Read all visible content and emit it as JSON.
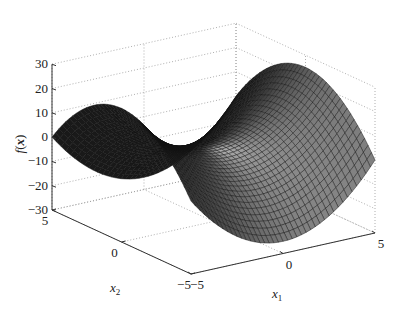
{
  "chart_data": {
    "type": "surface3d",
    "title": "",
    "function_shape": "saddle",
    "approx_formula": "f = x1^2 - x2^2",
    "xlabel": "x1",
    "ylabel": "x2",
    "zlabel": "f(x)",
    "x1_ticks": [
      -5,
      0,
      5
    ],
    "x2_ticks": [
      -5,
      0,
      5
    ],
    "z_ticks": [
      -30,
      -20,
      -10,
      0,
      10,
      20,
      30
    ],
    "x1_range": [
      -5,
      5
    ],
    "x2_range": [
      -5,
      5
    ],
    "zlim": [
      -30,
      30
    ],
    "grid": true,
    "grid_style": "dotted",
    "mesh_resolution": 41,
    "colormap": "gray",
    "edge_color": "#111111",
    "sample_points": [
      {
        "x1": -5,
        "x2": 0,
        "f": 25
      },
      {
        "x1": 5,
        "x2": 0,
        "f": 25
      },
      {
        "x1": 0,
        "x2": -5,
        "f": -25
      },
      {
        "x1": 0,
        "x2": 5,
        "f": -25
      },
      {
        "x1": 0,
        "x2": 0,
        "f": 0
      },
      {
        "x1": 5,
        "x2": 5,
        "f": 0
      },
      {
        "x1": -5,
        "x2": -5,
        "f": 0
      }
    ]
  },
  "labels": {
    "zlabel_f": "f",
    "zlabel_paren_open": "(",
    "zlabel_x": "x",
    "zlabel_paren_close": ")",
    "x1_main": "x",
    "x1_sub": "1",
    "x2_main": "x",
    "x2_sub": "2"
  },
  "projection": {
    "front_corner_px": [
      191,
      274
    ],
    "px_per_unit_x1": [
      18.4,
      -4.1
    ],
    "px_per_unit_x2": [
      -13.9,
      -6.4
    ],
    "px_per_unit_z": -2.43
  }
}
